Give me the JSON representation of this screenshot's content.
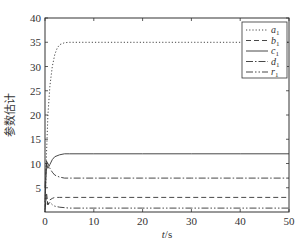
{
  "chart_data": {
    "type": "line",
    "title": "",
    "xlabel": "t/s",
    "ylabel": "参数估计",
    "xlim": [
      0,
      50
    ],
    "ylim": [
      0,
      40
    ],
    "xticks": [
      0,
      10,
      20,
      30,
      40,
      50
    ],
    "yticks": [
      5,
      10,
      15,
      20,
      25,
      30,
      35,
      40
    ],
    "grid": false,
    "legend_position": "upper right",
    "series": [
      {
        "name": "a1",
        "label_main": "a",
        "label_sub": "1",
        "style": "dotted",
        "x": [
          0,
          0.3,
          0.6,
          1,
          1.5,
          2,
          2.5,
          3,
          4,
          5,
          10,
          20,
          30,
          40,
          50
        ],
        "values": [
          0,
          12,
          20,
          26,
          30,
          32.5,
          33.8,
          34.5,
          34.9,
          35,
          35,
          35,
          35,
          35,
          35
        ]
      },
      {
        "name": "b1",
        "label_main": "b",
        "label_sub": "1",
        "style": "dashed",
        "x": [
          0,
          0.3,
          0.6,
          1,
          1.5,
          2,
          3,
          5,
          10,
          20,
          30,
          40,
          50
        ],
        "values": [
          1,
          4,
          1.5,
          2.5,
          2.8,
          3,
          3,
          3,
          3,
          3,
          3,
          3,
          3
        ]
      },
      {
        "name": "c1",
        "label_main": "c",
        "label_sub": "1",
        "style": "solid",
        "x": [
          0,
          0.3,
          0.6,
          1,
          1.5,
          2,
          3,
          4,
          5,
          10,
          20,
          30,
          40,
          50
        ],
        "values": [
          2,
          10,
          9,
          9.8,
          10.8,
          11.4,
          11.8,
          12,
          12,
          12,
          12,
          12,
          12,
          12
        ]
      },
      {
        "name": "d1",
        "label_main": "d",
        "label_sub": "1",
        "style": "dashdot",
        "x": [
          0,
          0.3,
          0.6,
          1,
          1.5,
          2,
          3,
          4,
          5,
          10,
          20,
          30,
          40,
          50
        ],
        "values": [
          5,
          10.5,
          10,
          9,
          8.2,
          7.6,
          7.2,
          7,
          7,
          7,
          7,
          7,
          7,
          7
        ]
      },
      {
        "name": "r1",
        "label_main": "r",
        "label_sub": "1",
        "style": "dashdotdot",
        "x": [
          0,
          0.3,
          0.6,
          1,
          1.5,
          2,
          3,
          5,
          10,
          20,
          30,
          40,
          50
        ],
        "values": [
          0.5,
          3,
          1.5,
          2,
          1.5,
          1.2,
          1,
          0.8,
          0.8,
          0.8,
          0.8,
          0.8,
          0.8
        ]
      }
    ]
  },
  "axes": {
    "xlabel_main": "t",
    "xlabel_unit": "/s",
    "ylabel": "参数估计"
  }
}
